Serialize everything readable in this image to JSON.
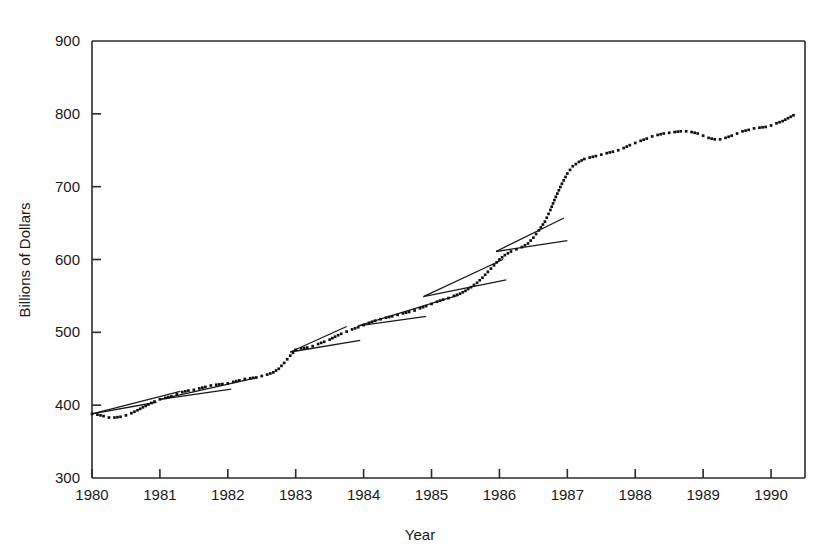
{
  "chart_data": {
    "type": "line",
    "title": "",
    "xlabel": "Year",
    "ylabel": "Billions of Dollars",
    "xlim": [
      1980.0,
      1990.5
    ],
    "ylim": [
      300,
      900
    ],
    "yticks": [
      300,
      400,
      500,
      600,
      700,
      800,
      900
    ],
    "xticks": [
      1980,
      1981,
      1982,
      1983,
      1984,
      1985,
      1986,
      1987,
      1988,
      1989,
      1990
    ],
    "xtick_labels": [
      "1980",
      "1981",
      "1982",
      "1983",
      "1984",
      "1985",
      "1986",
      "1987",
      "1988",
      "1989",
      "1990"
    ],
    "ytick_labels": [
      "300",
      "400",
      "500",
      "600",
      "700",
      "800",
      "900"
    ],
    "grid": false,
    "legend": null,
    "marker": "dotted",
    "series": [
      {
        "name": "Series",
        "style": "dotted-markers",
        "x": [
          1980.0,
          1980.08,
          1980.17,
          1980.25,
          1980.33,
          1980.42,
          1980.5,
          1980.58,
          1980.67,
          1980.75,
          1980.83,
          1980.92,
          1981.0,
          1981.08,
          1981.17,
          1981.25,
          1981.33,
          1981.42,
          1981.5,
          1981.58,
          1981.67,
          1981.75,
          1981.83,
          1981.92,
          1982.0,
          1982.08,
          1982.17,
          1982.25,
          1982.33,
          1982.42,
          1982.5,
          1982.58,
          1982.67,
          1982.75,
          1982.83,
          1982.92,
          1983.0,
          1983.08,
          1983.17,
          1983.25,
          1983.33,
          1983.42,
          1983.5,
          1983.58,
          1983.67,
          1983.75,
          1983.83,
          1983.92,
          1984.0,
          1984.08,
          1984.17,
          1984.25,
          1984.33,
          1984.42,
          1984.5,
          1984.58,
          1984.67,
          1984.75,
          1984.83,
          1984.92,
          1985.0,
          1985.08,
          1985.17,
          1985.25,
          1985.33,
          1985.42,
          1985.5,
          1985.58,
          1985.67,
          1985.75,
          1985.83,
          1985.92,
          1986.0,
          1986.08,
          1986.17,
          1986.25,
          1986.33,
          1986.42,
          1986.5,
          1986.58,
          1986.67,
          1986.75,
          1986.83,
          1986.92,
          1987.0,
          1987.08,
          1987.17,
          1987.25,
          1987.33,
          1987.42,
          1987.5,
          1987.58,
          1987.67,
          1987.75,
          1987.83,
          1987.92,
          1988.0,
          1988.08,
          1988.17,
          1988.25,
          1988.33,
          1988.42,
          1988.5,
          1988.58,
          1988.67,
          1988.75,
          1988.83,
          1988.92,
          1989.0,
          1989.08,
          1989.17,
          1989.25,
          1989.33,
          1989.42,
          1989.5,
          1989.58,
          1989.67,
          1989.75,
          1989.83,
          1989.92,
          1990.0,
          1990.08,
          1990.17,
          1990.25,
          1990.33
        ],
        "y": [
          388,
          387,
          385,
          383,
          383,
          384,
          386,
          389,
          393,
          397,
          401,
          405,
          408,
          410,
          412,
          415,
          418,
          420,
          421,
          423,
          425,
          427,
          428,
          429,
          430,
          432,
          434,
          436,
          437,
          438,
          440,
          442,
          445,
          450,
          458,
          468,
          476,
          478,
          479,
          481,
          484,
          487,
          490,
          494,
          498,
          501,
          504,
          507,
          510,
          513,
          516,
          518,
          520,
          522,
          524,
          526,
          528,
          530,
          533,
          536,
          539,
          542,
          545,
          547,
          550,
          553,
          557,
          562,
          568,
          575,
          583,
          592,
          600,
          606,
          611,
          614,
          617,
          622,
          630,
          640,
          652,
          668,
          686,
          704,
          718,
          728,
          734,
          738,
          740,
          742,
          744,
          746,
          748,
          750,
          753,
          757,
          760,
          763,
          766,
          769,
          771,
          773,
          774,
          775,
          776,
          776,
          775,
          773,
          770,
          767,
          765,
          765,
          767,
          770,
          773,
          776,
          778,
          780,
          781,
          782,
          784,
          787,
          790,
          794,
          798
        ]
      }
    ],
    "trend_segments": [
      {
        "name": "1980-a",
        "x1": 1980.0,
        "y1": 388,
        "x2": 1980.95,
        "y2": 404
      },
      {
        "name": "1980-b",
        "x1": 1980.0,
        "y1": 388,
        "x2": 1981.3,
        "y2": 419
      },
      {
        "name": "1981-a",
        "x1": 1981.0,
        "y1": 408,
        "x2": 1982.05,
        "y2": 422
      },
      {
        "name": "1981-b",
        "x1": 1981.0,
        "y1": 408,
        "x2": 1982.4,
        "y2": 437
      },
      {
        "name": "1982-a",
        "x1": 1982.92,
        "y1": 473,
        "x2": 1983.95,
        "y2": 489
      },
      {
        "name": "1982-b",
        "x1": 1982.92,
        "y1": 473,
        "x2": 1983.75,
        "y2": 508
      },
      {
        "name": "1983-a",
        "x1": 1983.92,
        "y1": 509,
        "x2": 1984.92,
        "y2": 522
      },
      {
        "name": "1983-b",
        "x1": 1983.92,
        "y1": 509,
        "x2": 1985.4,
        "y2": 551
      },
      {
        "name": "1984-a",
        "x1": 1984.88,
        "y1": 549,
        "x2": 1986.1,
        "y2": 572
      },
      {
        "name": "1984-b",
        "x1": 1984.88,
        "y1": 549,
        "x2": 1986.05,
        "y2": 600
      },
      {
        "name": "1985-a",
        "x1": 1985.95,
        "y1": 611,
        "x2": 1987.0,
        "y2": 626
      },
      {
        "name": "1985-b",
        "x1": 1985.95,
        "y1": 611,
        "x2": 1986.95,
        "y2": 657
      }
    ]
  }
}
